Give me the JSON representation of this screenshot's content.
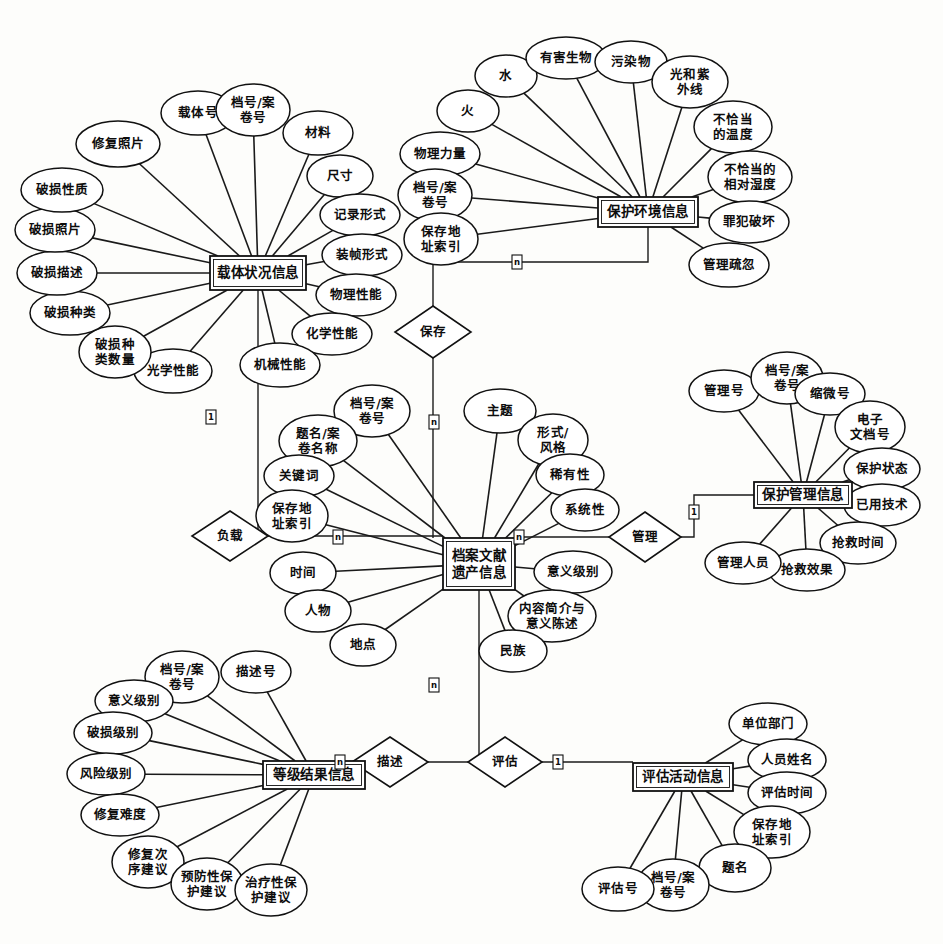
{
  "diagram": {
    "type": "entity-relationship-diagram",
    "notation": "Chen ER",
    "background_color": "#fdfdfb",
    "line_color": "#111111",
    "entities": [
      {
        "id": "carrier",
        "label": "载体状况信息",
        "x": 210,
        "y": 256,
        "w": 96,
        "h": 34,
        "attributes": [
          {
            "label": "修复照片",
            "cx": 118,
            "cy": 144,
            "rx": 42,
            "ry": 23,
            "lines": [
              "修复照片"
            ]
          },
          {
            "label": "载体号",
            "cx": 198,
            "cy": 113,
            "rx": 37,
            "ry": 22,
            "lines": [
              "载体号"
            ]
          },
          {
            "label": "档号/案卷号",
            "cx": 253,
            "cy": 110,
            "rx": 37,
            "ry": 26,
            "lines": [
              "档号/案",
              "卷号"
            ]
          },
          {
            "label": "材料",
            "cx": 318,
            "cy": 133,
            "rx": 35,
            "ry": 22,
            "lines": [
              "材料"
            ]
          },
          {
            "label": "尺寸",
            "cx": 340,
            "cy": 176,
            "rx": 33,
            "ry": 21,
            "lines": [
              "尺寸"
            ]
          },
          {
            "label": "记录形式",
            "cx": 360,
            "cy": 215,
            "rx": 40,
            "ry": 21,
            "lines": [
              "记录形式"
            ]
          },
          {
            "label": "装帧形式",
            "cx": 362,
            "cy": 255,
            "rx": 40,
            "ry": 21,
            "lines": [
              "装帧形式"
            ]
          },
          {
            "label": "物理性能",
            "cx": 356,
            "cy": 295,
            "rx": 40,
            "ry": 21,
            "lines": [
              "物理性能"
            ]
          },
          {
            "label": "化学性能",
            "cx": 332,
            "cy": 334,
            "rx": 40,
            "ry": 21,
            "lines": [
              "化学性能"
            ]
          },
          {
            "label": "机械性能",
            "cx": 280,
            "cy": 365,
            "rx": 40,
            "ry": 22,
            "lines": [
              "机械性能"
            ]
          },
          {
            "label": "光学性能",
            "cx": 173,
            "cy": 371,
            "rx": 39,
            "ry": 22,
            "lines": [
              "光学性能"
            ]
          },
          {
            "label": "破损种类数量",
            "cx": 115,
            "cy": 352,
            "rx": 36,
            "ry": 26,
            "lines": [
              "破损种",
              "类数量"
            ]
          },
          {
            "label": "破损种类",
            "cx": 70,
            "cy": 313,
            "rx": 40,
            "ry": 22,
            "lines": [
              "破损种类"
            ]
          },
          {
            "label": "破损描述",
            "cx": 57,
            "cy": 273,
            "rx": 40,
            "ry": 22,
            "lines": [
              "破损描述"
            ]
          },
          {
            "label": "破损照片",
            "cx": 55,
            "cy": 230,
            "rx": 40,
            "ry": 22,
            "lines": [
              "破损照片"
            ]
          },
          {
            "label": "破损性质",
            "cx": 62,
            "cy": 190,
            "rx": 41,
            "ry": 22,
            "lines": [
              "破损性质"
            ]
          }
        ]
      },
      {
        "id": "environment",
        "label": "保护环境信息",
        "x": 598,
        "y": 197,
        "w": 100,
        "h": 30,
        "attributes": [
          {
            "label": "火",
            "cx": 468,
            "cy": 111,
            "rx": 31,
            "ry": 21,
            "lines": [
              "火"
            ]
          },
          {
            "label": "水",
            "cx": 506,
            "cy": 76,
            "rx": 31,
            "ry": 21,
            "lines": [
              "水"
            ]
          },
          {
            "label": "有害生物",
            "cx": 566,
            "cy": 58,
            "rx": 40,
            "ry": 21,
            "lines": [
              "有害生物"
            ]
          },
          {
            "label": "污染物",
            "cx": 631,
            "cy": 62,
            "rx": 36,
            "ry": 21,
            "lines": [
              "污染物"
            ]
          },
          {
            "label": "光和紫外线",
            "cx": 690,
            "cy": 82,
            "rx": 38,
            "ry": 26,
            "lines": [
              "光和紫",
              "外线"
            ]
          },
          {
            "label": "不恰当的温度",
            "cx": 733,
            "cy": 127,
            "rx": 39,
            "ry": 26,
            "lines": [
              "不恰当",
              "的温度"
            ]
          },
          {
            "label": "不恰当的相对湿度",
            "cx": 750,
            "cy": 177,
            "rx": 42,
            "ry": 26,
            "lines": [
              "不恰当的",
              "相对湿度"
            ]
          },
          {
            "label": "罪犯破坏",
            "cx": 749,
            "cy": 222,
            "rx": 40,
            "ry": 21,
            "lines": [
              "罪犯破坏"
            ]
          },
          {
            "label": "管理疏忽",
            "cx": 729,
            "cy": 265,
            "rx": 40,
            "ry": 22,
            "lines": [
              "管理疏忽"
            ]
          },
          {
            "label": "物理力量",
            "cx": 440,
            "cy": 154,
            "rx": 40,
            "ry": 22,
            "lines": [
              "物理力量"
            ]
          },
          {
            "label": "档号/案卷号",
            "cx": 435,
            "cy": 195,
            "rx": 37,
            "ry": 26,
            "lines": [
              "档号/案",
              "卷号"
            ]
          },
          {
            "label": "保存地址索引",
            "cx": 441,
            "cy": 239,
            "rx": 37,
            "ry": 26,
            "lines": [
              "保存地",
              "址索引"
            ]
          }
        ]
      },
      {
        "id": "heritage",
        "label": "档案文献遗产信息",
        "x": 443,
        "y": 538,
        "w": 72,
        "h": 52,
        "lines": [
          "档案文献",
          "遗产信息"
        ],
        "attributes": [
          {
            "label": "档号/案卷号",
            "cx": 372,
            "cy": 411,
            "rx": 38,
            "ry": 26,
            "lines": [
              "档号/案",
              "卷号"
            ]
          },
          {
            "label": "题名/案卷名称",
            "cx": 318,
            "cy": 441,
            "rx": 39,
            "ry": 26,
            "lines": [
              "题名/案",
              "卷名称"
            ]
          },
          {
            "label": "关键词",
            "cx": 299,
            "cy": 476,
            "rx": 35,
            "ry": 21,
            "lines": [
              "关键词"
            ]
          },
          {
            "label": "保存地址索引",
            "cx": 292,
            "cy": 516,
            "rx": 36,
            "ry": 26,
            "lines": [
              "保存地",
              "址索引"
            ]
          },
          {
            "label": "时间",
            "cx": 303,
            "cy": 573,
            "rx": 33,
            "ry": 21,
            "lines": [
              "时间"
            ]
          },
          {
            "label": "人物",
            "cx": 318,
            "cy": 611,
            "rx": 33,
            "ry": 21,
            "lines": [
              "人物"
            ]
          },
          {
            "label": "地点",
            "cx": 363,
            "cy": 645,
            "rx": 33,
            "ry": 21,
            "lines": [
              "地点"
            ]
          },
          {
            "label": "主题",
            "cx": 500,
            "cy": 411,
            "rx": 36,
            "ry": 22,
            "lines": [
              "主题"
            ]
          },
          {
            "label": "形式/风格",
            "cx": 553,
            "cy": 440,
            "rx": 35,
            "ry": 26,
            "lines": [
              "形式/",
              "风格"
            ]
          },
          {
            "label": "稀有性",
            "cx": 570,
            "cy": 475,
            "rx": 34,
            "ry": 21,
            "lines": [
              "稀有性"
            ]
          },
          {
            "label": "系统性",
            "cx": 585,
            "cy": 510,
            "rx": 34,
            "ry": 21,
            "lines": [
              "系统性"
            ]
          },
          {
            "label": "意义级别",
            "cx": 573,
            "cy": 572,
            "rx": 39,
            "ry": 21,
            "lines": [
              "意义级别"
            ]
          },
          {
            "label": "内容简介与意义陈述",
            "cx": 552,
            "cy": 616,
            "rx": 44,
            "ry": 26,
            "lines": [
              "内容简介与",
              "意义陈述"
            ]
          },
          {
            "label": "民族",
            "cx": 513,
            "cy": 651,
            "rx": 34,
            "ry": 21,
            "lines": [
              "民族"
            ]
          }
        ]
      },
      {
        "id": "management",
        "label": "保护管理信息",
        "x": 754,
        "y": 482,
        "w": 98,
        "h": 26,
        "attributes": [
          {
            "label": "管理号",
            "cx": 724,
            "cy": 391,
            "rx": 35,
            "ry": 21,
            "lines": [
              "管理号"
            ]
          },
          {
            "label": "档号/案卷号",
            "cx": 787,
            "cy": 378,
            "rx": 36,
            "ry": 26,
            "lines": [
              "档号/案",
              "卷号"
            ]
          },
          {
            "label": "缩微号",
            "cx": 830,
            "cy": 394,
            "rx": 35,
            "ry": 21,
            "lines": [
              "缩微号"
            ]
          },
          {
            "label": "电子文档号",
            "cx": 870,
            "cy": 427,
            "rx": 35,
            "ry": 26,
            "lines": [
              "电子",
              "文档号"
            ]
          },
          {
            "label": "保护状态",
            "cx": 882,
            "cy": 469,
            "rx": 38,
            "ry": 21,
            "lines": [
              "保护状态"
            ]
          },
          {
            "label": "已用技术",
            "cx": 882,
            "cy": 505,
            "rx": 38,
            "ry": 21,
            "lines": [
              "已用技术"
            ]
          },
          {
            "label": "抢救时间",
            "cx": 858,
            "cy": 543,
            "rx": 38,
            "ry": 21,
            "lines": [
              "抢救时间"
            ]
          },
          {
            "label": "抢救效果",
            "cx": 807,
            "cy": 570,
            "rx": 38,
            "ry": 21,
            "lines": [
              "抢救效果"
            ]
          },
          {
            "label": "管理人员",
            "cx": 743,
            "cy": 563,
            "rx": 38,
            "ry": 21,
            "lines": [
              "管理人员"
            ]
          }
        ]
      },
      {
        "id": "grade",
        "label": "等级结果信息",
        "x": 263,
        "y": 761,
        "w": 102,
        "h": 28,
        "attributes": [
          {
            "label": "描述号",
            "cx": 256,
            "cy": 672,
            "rx": 35,
            "ry": 21,
            "lines": [
              "描述号"
            ]
          },
          {
            "label": "档号/案卷号",
            "cx": 182,
            "cy": 677,
            "rx": 37,
            "ry": 26,
            "lines": [
              "档号/案",
              "卷号"
            ]
          },
          {
            "label": "意义级别",
            "cx": 134,
            "cy": 701,
            "rx": 39,
            "ry": 21,
            "lines": [
              "意义级别"
            ]
          },
          {
            "label": "破损级别",
            "cx": 113,
            "cy": 733,
            "rx": 39,
            "ry": 21,
            "lines": [
              "破损级别"
            ]
          },
          {
            "label": "风险级别",
            "cx": 106,
            "cy": 774,
            "rx": 39,
            "ry": 21,
            "lines": [
              "风险级别"
            ]
          },
          {
            "label": "修复难度",
            "cx": 120,
            "cy": 815,
            "rx": 39,
            "ry": 21,
            "lines": [
              "修复难度"
            ]
          },
          {
            "label": "修复次序建议",
            "cx": 148,
            "cy": 862,
            "rx": 36,
            "ry": 26,
            "lines": [
              "修复次",
              "序建议"
            ]
          },
          {
            "label": "预防性保护建议",
            "cx": 207,
            "cy": 884,
            "rx": 36,
            "ry": 26,
            "lines": [
              "预防性保",
              "护建议"
            ]
          },
          {
            "label": "治疗性保护建议",
            "cx": 271,
            "cy": 890,
            "rx": 36,
            "ry": 26,
            "lines": [
              "治疗性保",
              "护建议"
            ]
          }
        ]
      },
      {
        "id": "assessment",
        "label": "评估活动信息",
        "x": 633,
        "y": 763,
        "w": 100,
        "h": 28,
        "attributes": [
          {
            "label": "单位部门",
            "cx": 768,
            "cy": 724,
            "rx": 39,
            "ry": 21,
            "lines": [
              "单位部门"
            ]
          },
          {
            "label": "人员姓名",
            "cx": 787,
            "cy": 760,
            "rx": 39,
            "ry": 21,
            "lines": [
              "人员姓名"
            ]
          },
          {
            "label": "评估时间",
            "cx": 787,
            "cy": 793,
            "rx": 39,
            "ry": 21,
            "lines": [
              "评估时间"
            ]
          },
          {
            "label": "保存地址索引",
            "cx": 772,
            "cy": 832,
            "rx": 38,
            "ry": 26,
            "lines": [
              "保存地",
              "址索引"
            ]
          },
          {
            "label": "题名",
            "cx": 735,
            "cy": 868,
            "rx": 36,
            "ry": 24,
            "lines": [
              "题名"
            ]
          },
          {
            "label": "档号/案卷号",
            "cx": 673,
            "cy": 885,
            "rx": 36,
            "ry": 26,
            "lines": [
              "档号/案",
              "卷号"
            ]
          },
          {
            "label": "评估号",
            "cx": 618,
            "cy": 889,
            "rx": 36,
            "ry": 22,
            "lines": [
              "评估号"
            ]
          }
        ]
      }
    ],
    "relationships": [
      {
        "id": "preserve",
        "label": "保存",
        "cx": 433,
        "cy": 332,
        "rx": 38,
        "ry": 26,
        "from": "environment",
        "to": "heritage",
        "cardinality_from": "n",
        "cardinality_to": "n"
      },
      {
        "id": "carry",
        "label": "负载",
        "cx": 230,
        "cy": 536,
        "rx": 38,
        "ry": 25,
        "from": "carrier",
        "to": "heritage",
        "cardinality_from": "1",
        "cardinality_to": "n"
      },
      {
        "id": "manage",
        "label": "管理",
        "cx": 645,
        "cy": 537,
        "rx": 36,
        "ry": 25,
        "from": "heritage",
        "to": "management",
        "cardinality_from": "n",
        "cardinality_to": "1"
      },
      {
        "id": "describe",
        "label": "描述",
        "cx": 390,
        "cy": 762,
        "rx": 38,
        "ry": 25,
        "from": "grade",
        "to": "heritage",
        "cardinality_from": "n",
        "cardinality_to": "n"
      },
      {
        "id": "evaluate",
        "label": "评估",
        "cx": 505,
        "cy": 762,
        "rx": 37,
        "ry": 25,
        "from": "heritage",
        "to": "assessment",
        "cardinality_from": "n",
        "cardinality_to": "1"
      }
    ],
    "cardinality_markers": [
      {
        "label": "n",
        "x": 517,
        "y": 262
      },
      {
        "label": "n",
        "x": 434,
        "y": 422
      },
      {
        "label": "1",
        "x": 211,
        "y": 417
      },
      {
        "label": "n",
        "x": 338,
        "y": 537
      },
      {
        "label": "n",
        "x": 519,
        "y": 537
      },
      {
        "label": "1",
        "x": 694,
        "y": 512
      },
      {
        "label": "n",
        "x": 434,
        "y": 685
      },
      {
        "label": "n",
        "x": 340,
        "y": 762
      },
      {
        "label": "1",
        "x": 558,
        "y": 762
      }
    ]
  }
}
